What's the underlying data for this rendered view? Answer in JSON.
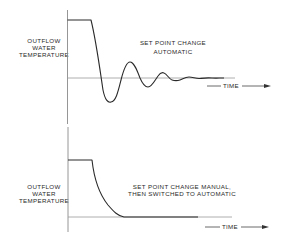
{
  "panels": [
    {
      "id": "top",
      "ylabel_lines": [
        "OUTFLOW",
        "WATER",
        "TEMPERATURE"
      ],
      "title_lines": [
        "SET POINT CHANGE",
        "AUTOMATIC"
      ],
      "time_label": "TIME",
      "response": "damped oscillation after step down, settling to set point"
    },
    {
      "id": "bottom",
      "ylabel_lines": [
        "OUTFLOW",
        "WATER",
        "TEMPERATURE"
      ],
      "title_lines": [
        "SET POINT CHANGE MANUAL,",
        "THEN SWITCHED TO AUTOMATIC"
      ],
      "time_label": "TIME",
      "response": "smooth exponential decay to set point without overshoot"
    }
  ],
  "colors": {
    "curve": "#2a2a2a",
    "axis": "#8a8a8a",
    "baseline": "#9a9a9a",
    "background": "#ffffff"
  }
}
